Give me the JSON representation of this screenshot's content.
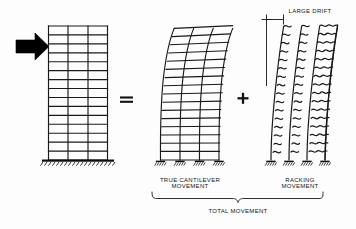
{
  "diagram": {
    "title_visible": false,
    "labels": {
      "large_drift": "LARGE DRIFT",
      "true_cantilever_line1": "TRUE CANTILEVER",
      "true_cantilever_line2": "MOVEMENT",
      "racking_line1": "RACKING",
      "racking_line2": "MOVEMENT",
      "total_movement": "TOTAL MOVEMENT"
    },
    "operators": {
      "equals": "=",
      "plus": "+"
    },
    "colors": {
      "ink": "#151515",
      "background": "#fdfdfd",
      "arrow": "#000000"
    },
    "frames": [
      {
        "name": "undeformed-frame",
        "bays": 3,
        "stories": 15,
        "deflection": "none",
        "support": "fixed-ground-hatch",
        "caption": ""
      },
      {
        "name": "cantilever-frame",
        "bays": 3,
        "stories": 15,
        "deflection": "flexural-cantilever-curve",
        "support": "pin-hatch-pads",
        "caption": "TRUE CANTILEVER MOVEMENT"
      },
      {
        "name": "racking-frame",
        "bays": 3,
        "stories": 15,
        "deflection": "shear-racking-s-curves",
        "support": "pin-hatch-pads",
        "caption": "RACKING MOVEMENT"
      }
    ],
    "load_arrow": {
      "name": "lateral-load-arrow",
      "direction": "right"
    },
    "dimension": {
      "name": "drift-dimension",
      "label": "LARGE DRIFT"
    }
  }
}
